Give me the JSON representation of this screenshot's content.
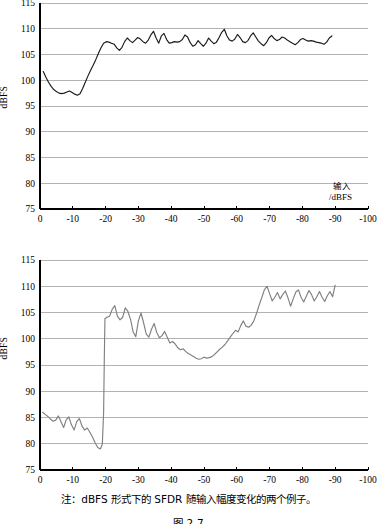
{
  "figure": {
    "caption": "注：dBFS 形式下的 SFDR 随输入幅度变化的两个例子。",
    "number": "图 2-7"
  },
  "colors": {
    "axis": "#000000",
    "grid": "#b3b3b3",
    "series_top": "#1a1a1a",
    "series_bottom": "#808080",
    "background": "#ffffff"
  },
  "chart_data": [
    {
      "id": "top",
      "type": "line",
      "title": "",
      "xlabel_cn": "输入",
      "xlabel_unit": "/dBFS",
      "ylabel": "dBFS",
      "xlim": [
        0,
        -100
      ],
      "ylim": [
        75,
        115
      ],
      "xticks": [
        "0",
        "-10",
        "-20",
        "-30",
        "-40",
        "-50",
        "-60",
        "-70",
        "-80",
        "-90",
        "-100"
      ],
      "xtick_values": [
        0,
        -10,
        -20,
        -30,
        -40,
        -50,
        -60,
        -70,
        -80,
        -90,
        -100
      ],
      "yticks": [
        "75",
        "80",
        "85",
        "90",
        "95",
        "100",
        "105",
        "110",
        "115"
      ],
      "ytick_values": [
        75,
        80,
        85,
        90,
        95,
        100,
        105,
        110,
        115
      ],
      "grid": true,
      "legend": "none",
      "series": [
        {
          "name": "SFDR (dBFS) example 1",
          "x": [
            -1.0,
            -1.8,
            -2.6,
            -3.4,
            -4.2,
            -5.0,
            -5.8,
            -6.6,
            -7.4,
            -8.2,
            -9.0,
            -9.8,
            -10.6,
            -11.4,
            -12.2,
            -13.0,
            -13.8,
            -14.6,
            -15.4,
            -16.2,
            -17.0,
            -17.8,
            -18.6,
            -19.4,
            -20.2,
            -21.0,
            -21.8,
            -22.6,
            -23.4,
            -24.2,
            -25.0,
            -25.8,
            -26.6,
            -27.4,
            -28.2,
            -29.0,
            -29.8,
            -30.6,
            -31.4,
            -32.2,
            -33.0,
            -33.8,
            -34.6,
            -35.4,
            -36.2,
            -37.0,
            -37.8,
            -38.6,
            -39.4,
            -40.2,
            -41.0,
            -41.8,
            -42.6,
            -43.4,
            -44.2,
            -45.0,
            -45.8,
            -46.6,
            -47.4,
            -48.2,
            -49.0,
            -49.8,
            -50.6,
            -51.4,
            -52.2,
            -53.0,
            -53.8,
            -54.6,
            -55.4,
            -56.2,
            -57.0,
            -57.8,
            -58.6,
            -59.4,
            -60.2,
            -61.0,
            -61.8,
            -62.6,
            -63.4,
            -64.2,
            -65.0,
            -65.8,
            -66.6,
            -67.4,
            -68.2,
            -69.0,
            -69.8,
            -70.6,
            -71.4,
            -72.2,
            -73.0,
            -73.8,
            -74.6,
            -75.4,
            -76.2,
            -77.0,
            -77.8,
            -78.6,
            -79.4,
            -80.2,
            -81.0,
            -81.8,
            -82.6,
            -83.4,
            -84.2,
            -85.0,
            -85.8,
            -86.6,
            -87.4,
            -88.2,
            -89.0
          ],
          "y": [
            101.7,
            100.6,
            99.6,
            98.8,
            98.2,
            97.8,
            97.5,
            97.4,
            97.5,
            97.7,
            97.9,
            97.6,
            97.3,
            97.1,
            97.4,
            98.4,
            99.6,
            100.8,
            101.9,
            102.9,
            104.0,
            105.2,
            106.3,
            107.2,
            107.5,
            107.4,
            107.2,
            107.0,
            106.3,
            105.8,
            106.4,
            107.5,
            108.2,
            107.7,
            107.3,
            107.8,
            108.3,
            108.0,
            107.5,
            107.2,
            107.8,
            108.8,
            109.5,
            108.2,
            107.2,
            108.6,
            109.1,
            107.9,
            107.2,
            107.3,
            107.5,
            107.4,
            107.5,
            107.9,
            108.8,
            108.4,
            107.3,
            106.6,
            106.9,
            107.7,
            107.1,
            106.6,
            107.2,
            108.2,
            107.6,
            107.1,
            107.4,
            108.3,
            109.3,
            109.9,
            108.6,
            107.8,
            107.6,
            108.0,
            108.9,
            108.3,
            107.5,
            107.3,
            107.7,
            108.6,
            109.2,
            108.4,
            107.6,
            107.1,
            106.7,
            107.3,
            108.2,
            108.7,
            108.1,
            107.7,
            107.9,
            108.4,
            108.2,
            107.8,
            107.5,
            107.2,
            106.9,
            107.3,
            107.9,
            108.1,
            107.8,
            107.6,
            107.7,
            107.6,
            107.4,
            107.3,
            107.2,
            107.0,
            107.4,
            108.2,
            108.6
          ]
        }
      ]
    },
    {
      "id": "bottom",
      "type": "line",
      "title": "",
      "xlabel_cn": "输入",
      "xlabel_unit": "/dBFS",
      "ylabel": "dBFS",
      "xlim": [
        0,
        -100
      ],
      "ylim": [
        75,
        115
      ],
      "xticks": [
        "0",
        "-10",
        "-20",
        "-30",
        "-40",
        "-50",
        "-60",
        "-70",
        "-80",
        "-90",
        "-100"
      ],
      "xtick_values": [
        0,
        -10,
        -20,
        -30,
        -40,
        -50,
        -60,
        -70,
        -80,
        -90,
        -100
      ],
      "yticks": [
        "75",
        "80",
        "85",
        "90",
        "95",
        "100",
        "105",
        "110",
        "115"
      ],
      "ytick_values": [
        75,
        80,
        85,
        90,
        95,
        100,
        105,
        110,
        115
      ],
      "grid": true,
      "legend": "none",
      "series": [
        {
          "name": "SFDR (dBFS) example 2",
          "x": [
            -0.8,
            -1.6,
            -2.4,
            -3.2,
            -4.0,
            -4.8,
            -5.6,
            -6.4,
            -7.2,
            -8.0,
            -8.8,
            -9.6,
            -10.4,
            -11.2,
            -12.0,
            -12.8,
            -13.6,
            -14.4,
            -15.2,
            -16.0,
            -16.8,
            -17.6,
            -18.4,
            -19.0,
            -19.4,
            -19.6,
            -19.8,
            -20.4,
            -21.2,
            -22.0,
            -22.8,
            -23.6,
            -24.4,
            -25.2,
            -26.0,
            -26.8,
            -27.6,
            -28.4,
            -29.2,
            -30.0,
            -30.8,
            -31.6,
            -32.4,
            -33.2,
            -34.0,
            -34.8,
            -35.6,
            -36.4,
            -37.2,
            -38.0,
            -38.8,
            -39.6,
            -40.4,
            -41.2,
            -42.0,
            -42.8,
            -43.6,
            -44.4,
            -45.2,
            -46.0,
            -46.8,
            -47.6,
            -48.4,
            -49.2,
            -50.0,
            -50.8,
            -51.6,
            -52.4,
            -53.2,
            -54.0,
            -54.8,
            -55.6,
            -56.4,
            -57.2,
            -58.0,
            -58.8,
            -59.6,
            -60.4,
            -61.2,
            -62.0,
            -62.8,
            -63.6,
            -64.4,
            -65.2,
            -66.0,
            -66.8,
            -67.6,
            -68.4,
            -69.2,
            -70.0,
            -70.8,
            -71.6,
            -72.4,
            -73.2,
            -74.0,
            -74.8,
            -75.6,
            -76.4,
            -77.2,
            -78.0,
            -78.8,
            -79.6,
            -80.4,
            -81.2,
            -82.0,
            -82.8,
            -83.6,
            -84.4,
            -85.2,
            -86.0,
            -86.8,
            -87.6,
            -88.4,
            -89.2,
            -90.0
          ],
          "y": [
            86.0,
            85.6,
            85.2,
            84.7,
            84.3,
            84.5,
            85.3,
            84.2,
            83.1,
            84.6,
            85.1,
            83.6,
            82.6,
            84.2,
            84.8,
            83.4,
            82.6,
            83.0,
            82.2,
            81.3,
            80.2,
            79.3,
            79.0,
            79.9,
            86.0,
            96.0,
            103.8,
            104.1,
            104.3,
            105.6,
            106.3,
            104.3,
            103.6,
            104.1,
            105.9,
            105.2,
            103.7,
            101.3,
            100.4,
            103.4,
            104.9,
            103.0,
            100.9,
            100.3,
            101.8,
            102.9,
            101.2,
            100.2,
            100.6,
            101.4,
            100.3,
            99.2,
            99.5,
            99.0,
            98.3,
            97.9,
            98.1,
            97.6,
            97.2,
            96.9,
            96.6,
            96.3,
            96.1,
            96.2,
            96.5,
            96.3,
            96.4,
            96.6,
            97.0,
            97.5,
            98.0,
            98.4,
            98.9,
            99.6,
            100.3,
            101.0,
            101.6,
            101.3,
            102.5,
            103.4,
            102.4,
            102.2,
            102.6,
            103.4,
            104.8,
            106.4,
            107.8,
            109.3,
            110.0,
            108.6,
            107.2,
            107.9,
            108.8,
            107.6,
            108.4,
            109.1,
            107.8,
            106.2,
            107.6,
            108.9,
            109.3,
            107.9,
            107.0,
            108.1,
            109.2,
            108.4,
            107.2,
            108.0,
            109.0,
            107.9,
            107.1,
            108.2,
            109.0,
            108.0,
            110.2
          ]
        }
      ]
    }
  ]
}
